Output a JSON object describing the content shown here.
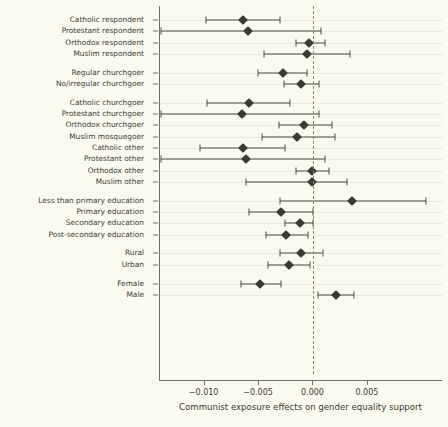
{
  "chart_data": {
    "type": "scatter",
    "subtype": "forest-plot",
    "title": "",
    "xlabel": "Communist exposure effects on gender equality support",
    "ylabel": "",
    "xlim": [
      -0.0141,
      0.0119
    ],
    "xticks": [
      -0.01,
      -0.005,
      0.0,
      0.005
    ],
    "xticklabels": [
      "−0.010",
      "−0.005",
      "0.000",
      "0.005"
    ],
    "grid": true,
    "zero_reference_line": 0.0,
    "legend": null,
    "estimate_label": "estimate",
    "ci_label": "95% CI",
    "groups": [
      {
        "name": "Religious affiliation",
        "rows": [
          {
            "label": "Catholic respondent",
            "estimate": -0.00651,
            "ci_low": -0.00991,
            "ci_high": -0.00303
          },
          {
            "label": "Protestant respondent",
            "estimate": -0.00606,
            "ci_low": -0.01404,
            "ci_high": 0.00073
          },
          {
            "label": "Orthodox respondent",
            "estimate": -0.00037,
            "ci_low": -0.00156,
            "ci_high": 0.0011
          },
          {
            "label": "Muslim respondent",
            "estimate": -0.00064,
            "ci_low": -0.00459,
            "ci_high": 0.00339
          }
        ]
      },
      {
        "name": "Religious attendance",
        "rows": [
          {
            "label": "Regular churchgoer",
            "estimate": -0.00284,
            "ci_low": -0.00514,
            "ci_high": -0.00055
          },
          {
            "label": "No/irregular churchgoer",
            "estimate": -0.00119,
            "ci_low": -0.00275,
            "ci_high": 0.00055
          }
        ]
      },
      {
        "name": "Affiliation by attendance",
        "rows": [
          {
            "label": "Catholic churchgoer",
            "estimate": -0.00596,
            "ci_low": -0.00982,
            "ci_high": -0.0022
          },
          {
            "label": "Protestant churchgoer",
            "estimate": -0.00661,
            "ci_low": -0.01404,
            "ci_high": 0.00055
          },
          {
            "label": "Orthodox churchgoer",
            "estimate": -0.00083,
            "ci_low": -0.00321,
            "ci_high": 0.00174
          },
          {
            "label": "Muslim mosquegoer",
            "estimate": -0.00147,
            "ci_low": -0.00477,
            "ci_high": 0.00202
          },
          {
            "label": "Catholic other",
            "estimate": -0.00651,
            "ci_low": -0.01046,
            "ci_high": -0.00257
          },
          {
            "label": "Protestant other",
            "estimate": -0.00624,
            "ci_low": -0.01404,
            "ci_high": 0.0011
          },
          {
            "label": "Orthodox other",
            "estimate": -9e-05,
            "ci_low": -0.00156,
            "ci_high": 0.00147
          },
          {
            "label": "Muslim other",
            "estimate": -9e-05,
            "ci_low": -0.00624,
            "ci_high": 0.00312
          }
        ]
      },
      {
        "name": "Education",
        "rows": [
          {
            "label": "Less than primary education",
            "estimate": 0.00358,
            "ci_low": -0.00312,
            "ci_high": 0.01037
          },
          {
            "label": "Primary education",
            "estimate": -0.00294,
            "ci_low": -0.00596,
            "ci_high": 0.0
          },
          {
            "label": "Secondary education",
            "estimate": -0.00128,
            "ci_low": -0.00257,
            "ci_high": 0.0
          },
          {
            "label": "Post-secondary education",
            "estimate": -0.00248,
            "ci_low": -0.0044,
            "ci_high": -0.00046
          }
        ]
      },
      {
        "name": "Settlement",
        "rows": [
          {
            "label": "Rural",
            "estimate": -0.00119,
            "ci_low": -0.00303,
            "ci_high": 0.00083
          },
          {
            "label": "Urban",
            "estimate": -0.00229,
            "ci_low": -0.00422,
            "ci_high": -0.00028
          }
        ]
      },
      {
        "name": "Gender",
        "rows": [
          {
            "label": "Female",
            "estimate": -0.00495,
            "ci_low": -0.0067,
            "ci_high": -0.00294
          },
          {
            "label": "Male",
            "estimate": 0.00211,
            "ci_low": 0.00046,
            "ci_high": 0.00376
          }
        ]
      }
    ]
  }
}
